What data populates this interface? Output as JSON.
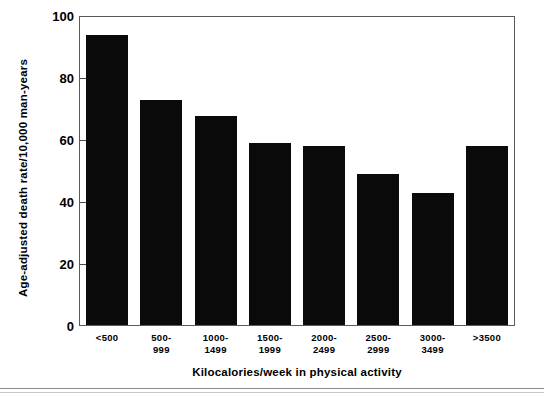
{
  "chart_data": {
    "type": "bar",
    "title": "",
    "xlabel": "Kilocalories/week in physical activity",
    "ylabel": "Age-adjusted death rate/10,000 man-years",
    "categories": [
      "<500",
      "500-\n999",
      "1000-\n1499",
      "1500-\n1999",
      "2000-\n2499",
      "2500-\n2999",
      "3000-\n3499",
      ">3500"
    ],
    "category_labels_flat": [
      "<500",
      "500-999",
      "1000-1499",
      "1500-1999",
      "2000-2499",
      "2500-2999",
      "3000-3499",
      ">3500"
    ],
    "values": [
      94,
      73,
      68,
      59,
      58,
      49,
      43,
      58
    ],
    "ylim": [
      0,
      100
    ],
    "yticks": [
      0,
      20,
      40,
      60,
      80,
      100
    ],
    "ytick_labels": [
      "0",
      "20",
      "40",
      "60",
      "80",
      "100"
    ],
    "xlim_note": "categorical",
    "grid": false,
    "legend": "none",
    "bar_color": "#0a0a0a",
    "frame_color": "#5a5a5a",
    "background": "#ffffff"
  },
  "figure": {
    "bottom_rule_color": "#8d8d8d"
  }
}
